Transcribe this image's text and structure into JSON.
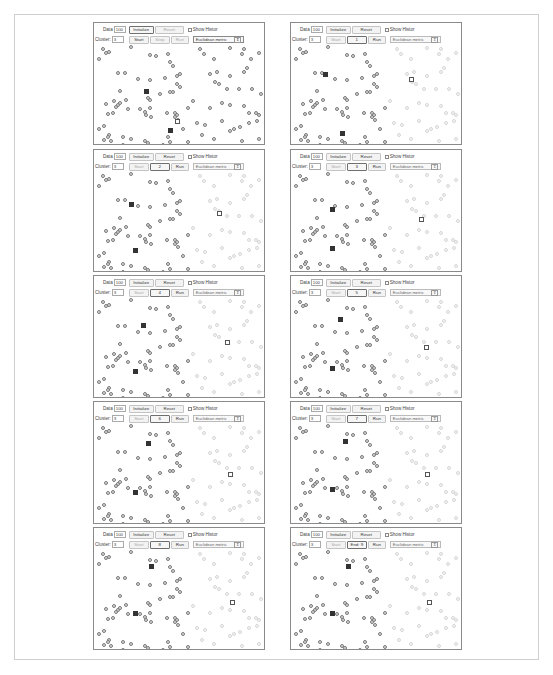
{
  "common": {
    "data_label": "Data",
    "data_value": "100",
    "initialize_label": "Initialize",
    "reset_label": "Reset",
    "show_history_label": "Show Histor",
    "cluster_label": "Cluster:",
    "cluster_value": "3",
    "start_label": "Start",
    "step_label": "Step",
    "run_label": "Run",
    "metric_label": "Euclidean metric",
    "metric_arrow": "⇕"
  },
  "panels": [
    {
      "step_text": "Step",
      "highlight": "initialize",
      "start_dim": false,
      "step_dim": true,
      "run_dim": true,
      "reset_dim": true,
      "metric_active": true,
      "faint_right": false,
      "centroids": [
        [
          0.3,
          0.47,
          "filled"
        ],
        [
          0.44,
          0.87,
          "filled"
        ],
        [
          0.48,
          0.78,
          "hollow"
        ]
      ]
    },
    {
      "step_text": "1",
      "highlight": "step",
      "start_dim": true,
      "step_dim": false,
      "run_dim": false,
      "reset_dim": false,
      "metric_active": false,
      "faint_right": true,
      "centroids": [
        [
          0.19,
          0.3,
          "filled"
        ],
        [
          0.29,
          0.9,
          "filled"
        ],
        [
          0.7,
          0.35,
          "hollow"
        ]
      ]
    },
    {
      "step_text": "2",
      "highlight": "step",
      "start_dim": true,
      "step_dim": false,
      "run_dim": false,
      "reset_dim": false,
      "metric_active": false,
      "faint_right": true,
      "centroids": [
        [
          0.21,
          0.33,
          "filled"
        ],
        [
          0.23,
          0.8,
          "filled"
        ],
        [
          0.73,
          0.42,
          "hollow"
        ]
      ]
    },
    {
      "step_text": "3",
      "highlight": "step",
      "start_dim": true,
      "step_dim": false,
      "run_dim": false,
      "reset_dim": false,
      "metric_active": false,
      "faint_right": true,
      "centroids": [
        [
          0.23,
          0.38,
          "filled"
        ],
        [
          0.23,
          0.78,
          "filled"
        ],
        [
          0.76,
          0.48,
          "hollow"
        ]
      ]
    },
    {
      "step_text": "4",
      "highlight": "step",
      "start_dim": true,
      "step_dim": false,
      "run_dim": false,
      "reset_dim": false,
      "metric_active": false,
      "faint_right": true,
      "centroids": [
        [
          0.28,
          0.28,
          "filled"
        ],
        [
          0.23,
          0.75,
          "filled"
        ],
        [
          0.78,
          0.45,
          "hollow"
        ]
      ]
    },
    {
      "step_text": "5",
      "highlight": "step",
      "start_dim": true,
      "step_dim": false,
      "run_dim": false,
      "reset_dim": false,
      "metric_active": false,
      "faint_right": true,
      "centroids": [
        [
          0.28,
          0.22,
          "filled"
        ],
        [
          0.23,
          0.72,
          "filled"
        ],
        [
          0.79,
          0.5,
          "hollow"
        ]
      ]
    },
    {
      "step_text": "6",
      "highlight": "step",
      "start_dim": true,
      "step_dim": false,
      "run_dim": false,
      "reset_dim": false,
      "metric_active": false,
      "faint_right": true,
      "centroids": [
        [
          0.31,
          0.2,
          "filled"
        ],
        [
          0.23,
          0.7,
          "filled"
        ],
        [
          0.8,
          0.52,
          "hollow"
        ]
      ]
    },
    {
      "step_text": "7",
      "highlight": "step",
      "start_dim": true,
      "step_dim": false,
      "run_dim": false,
      "reset_dim": false,
      "metric_active": false,
      "faint_right": true,
      "centroids": [
        [
          0.31,
          0.18,
          "filled"
        ],
        [
          0.23,
          0.67,
          "filled"
        ],
        [
          0.8,
          0.52,
          "hollow"
        ]
      ]
    },
    {
      "step_text": "8",
      "highlight": "step",
      "start_dim": true,
      "step_dim": false,
      "run_dim": false,
      "reset_dim": false,
      "metric_active": false,
      "faint_right": true,
      "centroids": [
        [
          0.33,
          0.17,
          "filled"
        ],
        [
          0.23,
          0.65,
          "filled"
        ],
        [
          0.81,
          0.54,
          "hollow"
        ]
      ]
    },
    {
      "step_text": "End: 9",
      "highlight": "step",
      "start_dim": true,
      "step_dim": false,
      "run_dim": false,
      "reset_dim": false,
      "metric_active": false,
      "faint_right": true,
      "centroids": [
        [
          0.33,
          0.17,
          "filled"
        ],
        [
          0.23,
          0.65,
          "filled"
        ],
        [
          0.81,
          0.54,
          "hollow"
        ]
      ]
    }
  ],
  "points": [
    [
      0.04,
      0.05
    ],
    [
      0.08,
      0.08
    ],
    [
      0.06,
      0.09
    ],
    [
      0.02,
      0.15
    ],
    [
      0.21,
      0.03
    ],
    [
      0.32,
      0.11
    ],
    [
      0.36,
      0.12
    ],
    [
      0.43,
      0.1
    ],
    [
      0.46,
      0.22
    ],
    [
      0.44,
      0.18
    ],
    [
      0.13,
      0.29
    ],
    [
      0.17,
      0.29
    ],
    [
      0.25,
      0.35
    ],
    [
      0.32,
      0.36
    ],
    [
      0.41,
      0.34
    ],
    [
      0.48,
      0.32
    ],
    [
      0.5,
      0.3
    ],
    [
      0.48,
      0.4
    ],
    [
      0.5,
      0.43
    ],
    [
      0.14,
      0.47
    ],
    [
      0.38,
      0.51
    ],
    [
      0.44,
      0.48
    ],
    [
      0.46,
      0.48
    ],
    [
      0.11,
      0.58
    ],
    [
      0.06,
      0.61
    ],
    [
      0.13,
      0.62
    ],
    [
      0.12,
      0.64
    ],
    [
      0.14,
      0.6
    ],
    [
      0.18,
      0.57
    ],
    [
      0.19,
      0.66
    ],
    [
      0.26,
      0.66
    ],
    [
      0.31,
      0.55
    ],
    [
      0.32,
      0.57
    ],
    [
      0.32,
      0.65
    ],
    [
      0.29,
      0.69
    ],
    [
      0.3,
      0.72
    ],
    [
      0.33,
      0.74
    ],
    [
      0.07,
      0.71
    ],
    [
      0.1,
      0.7
    ],
    [
      0.02,
      0.86
    ],
    [
      0.05,
      0.83
    ],
    [
      0.42,
      0.7
    ],
    [
      0.47,
      0.7
    ],
    [
      0.48,
      0.72
    ],
    [
      0.47,
      0.74
    ],
    [
      0.49,
      0.77
    ],
    [
      0.08,
      0.92
    ],
    [
      0.07,
      0.94
    ],
    [
      0.05,
      0.97
    ],
    [
      0.09,
      0.98
    ],
    [
      0.16,
      0.94
    ],
    [
      0.21,
      0.96
    ],
    [
      0.29,
      0.98
    ],
    [
      0.31,
      1.0
    ],
    [
      0.43,
      0.94
    ],
    [
      0.44,
      0.99
    ],
    [
      0.16,
      1.02
    ],
    [
      0.4,
      1.02
    ],
    [
      0.62,
      0.05
    ],
    [
      0.64,
      0.1
    ],
    [
      0.8,
      0.04
    ],
    [
      0.88,
      0.05
    ],
    [
      0.87,
      0.1
    ],
    [
      0.7,
      0.15
    ],
    [
      0.92,
      0.15
    ],
    [
      0.97,
      0.09
    ],
    [
      0.68,
      0.3
    ],
    [
      0.72,
      0.28
    ],
    [
      0.8,
      0.32
    ],
    [
      0.88,
      0.28
    ],
    [
      0.9,
      0.24
    ],
    [
      0.71,
      0.38
    ],
    [
      0.73,
      0.4
    ],
    [
      0.78,
      0.45
    ],
    [
      0.85,
      0.45
    ],
    [
      0.93,
      0.45
    ],
    [
      0.98,
      0.5
    ],
    [
      0.58,
      0.58
    ],
    [
      0.55,
      0.65
    ],
    [
      0.68,
      0.65
    ],
    [
      0.75,
      0.6
    ],
    [
      0.8,
      0.62
    ],
    [
      0.88,
      0.63
    ],
    [
      0.91,
      0.7
    ],
    [
      0.95,
      0.7
    ],
    [
      0.97,
      0.72
    ],
    [
      0.6,
      0.8
    ],
    [
      0.65,
      0.82
    ],
    [
      0.75,
      0.78
    ],
    [
      0.82,
      0.86
    ],
    [
      0.8,
      0.88
    ],
    [
      0.86,
      0.84
    ],
    [
      0.91,
      0.8
    ],
    [
      0.96,
      0.78
    ],
    [
      0.63,
      0.92
    ],
    [
      0.7,
      0.96
    ],
    [
      0.87,
      0.98
    ],
    [
      0.97,
      0.96
    ],
    [
      0.52,
      0.86
    ],
    [
      0.55,
      0.99
    ]
  ],
  "layout": {
    "columns_x": [
      93,
      290
    ],
    "rows_y": [
      22,
      149,
      275,
      401,
      527
    ]
  }
}
